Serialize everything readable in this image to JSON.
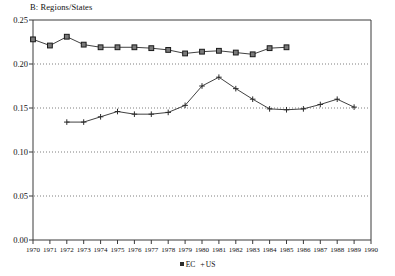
{
  "chart_data": {
    "type": "line",
    "title": "B: Regions/States",
    "xlabel": "",
    "ylabel": "",
    "xlim": [
      1970,
      1990
    ],
    "ylim": [
      0.0,
      0.25
    ],
    "grid": true,
    "grid_axis": "y",
    "grid_style": "dotted",
    "legend_position": "bottom-center",
    "x_tick_labels": [
      "1970",
      "1971",
      "1972",
      "1973",
      "1974",
      "1975",
      "1976",
      "1977",
      "1978",
      "1979",
      "1980",
      "1981",
      "1982",
      "1983",
      "1984",
      "1985",
      "1986",
      "1987",
      "1988",
      "1989",
      "1990"
    ],
    "y_tick_labels": [
      "0.00",
      "0.05",
      "0.10",
      "0.15",
      "0.20",
      "0.25"
    ],
    "y_tick_values": [
      0.0,
      0.05,
      0.1,
      0.15,
      0.2,
      0.25
    ],
    "series": [
      {
        "name": "EC",
        "marker": "square",
        "legend_label": "EC",
        "color": "#2b2b2b",
        "x": [
          1970,
          1971,
          1972,
          1973,
          1974,
          1975,
          1976,
          1977,
          1978,
          1979,
          1980,
          1981,
          1982,
          1983,
          1984,
          1985
        ],
        "values": [
          0.228,
          0.221,
          0.231,
          0.222,
          0.219,
          0.219,
          0.219,
          0.218,
          0.216,
          0.212,
          0.214,
          0.215,
          0.213,
          0.211,
          0.218,
          0.219
        ]
      },
      {
        "name": "US",
        "marker": "plus",
        "legend_label": "US",
        "color": "#2b2b2b",
        "x": [
          1972,
          1973,
          1974,
          1975,
          1976,
          1977,
          1978,
          1979,
          1980,
          1981,
          1982,
          1983,
          1984,
          1985,
          1986,
          1987,
          1988,
          1989
        ],
        "values": [
          0.134,
          0.134,
          0.14,
          0.146,
          0.143,
          0.143,
          0.145,
          0.153,
          0.175,
          0.185,
          0.172,
          0.16,
          0.149,
          0.148,
          0.149,
          0.154,
          0.16,
          0.151
        ]
      }
    ]
  },
  "legend": {
    "entries": [
      {
        "label": "EC",
        "marker": "square-marker-icon"
      },
      {
        "label": "US",
        "marker": "plus-marker-icon"
      }
    ]
  }
}
